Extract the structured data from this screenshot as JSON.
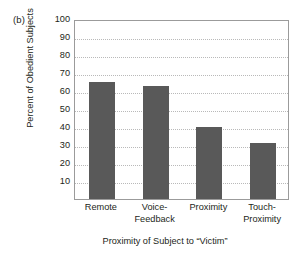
{
  "panel_label": "(b)",
  "chart_data": {
    "type": "bar",
    "title": "",
    "categories": [
      "Remote",
      "Voice-Feedback",
      "Proximity",
      "Touch-Proximity"
    ],
    "category_lines": [
      [
        "Remote"
      ],
      [
        "Voice-",
        "Feedback"
      ],
      [
        "Proximity"
      ],
      [
        "Touch-",
        "Proximity"
      ]
    ],
    "values": [
      65,
      63,
      40,
      31
    ],
    "xlabel": "Proximity of Subject to “Victim”",
    "ylabel": "Percent of Obedient Subjects",
    "ylim": [
      0,
      100
    ],
    "ytick_values": [
      10,
      20,
      30,
      40,
      50,
      60,
      70,
      80,
      90,
      100
    ],
    "ytick_labels": [
      "10",
      "20",
      "30",
      "40",
      "50",
      "60",
      "70",
      "80",
      "90",
      "100"
    ],
    "grid": "horizontal-dotted",
    "legend": null,
    "bar_color": "#595959",
    "grid_color": "#b9b9b9",
    "frame_color": "#9b9b9b",
    "text_color": "#231f20",
    "background": "#ffffff"
  }
}
